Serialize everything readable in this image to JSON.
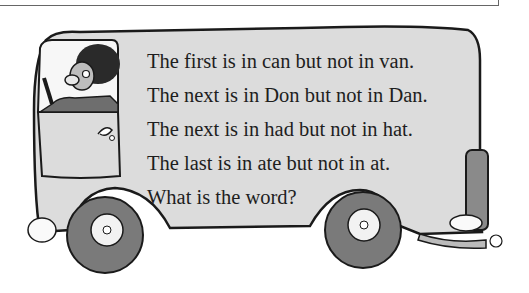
{
  "puzzle": {
    "lines": [
      "The first is in can but not in van.",
      "The next is in Don but not in Dan.",
      "The next is in had but not in hat.",
      "The last is in ate but not in at.",
      "What is the word?"
    ]
  },
  "illustration": {
    "subject": "van-with-driver",
    "colors": {
      "body": "#dcdcdc",
      "outline": "#1a1a1a",
      "tire": "#7a7a7a",
      "hair": "#2a2a2a",
      "sleeve": "#6e6e6e",
      "face": "#bdbdbd"
    }
  }
}
